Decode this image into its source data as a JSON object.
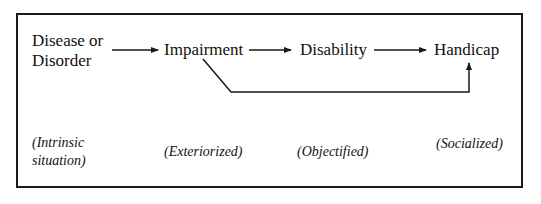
{
  "diagram": {
    "type": "flow",
    "nodes": [
      {
        "id": "disease",
        "label_line1": "Disease or",
        "label_line2": "Disorder"
      },
      {
        "id": "impairment",
        "label": "Impairment"
      },
      {
        "id": "disability",
        "label": "Disability"
      },
      {
        "id": "handicap",
        "label": "Handicap"
      }
    ],
    "edges": [
      {
        "from": "disease",
        "to": "impairment"
      },
      {
        "from": "impairment",
        "to": "disability"
      },
      {
        "from": "disability",
        "to": "handicap"
      },
      {
        "from": "impairment",
        "to": "handicap",
        "style": "bypass"
      }
    ],
    "annotations": [
      {
        "for": "disease",
        "line1": "(Intrinsic",
        "line2": "situation)"
      },
      {
        "for": "impairment",
        "text": "(Exteriorized)"
      },
      {
        "for": "disability",
        "text": "(Objectified)"
      },
      {
        "for": "handicap",
        "text": "(Socialized)"
      }
    ],
    "colors": {
      "line": "#1a1a1a",
      "background": "#ffffff"
    }
  }
}
